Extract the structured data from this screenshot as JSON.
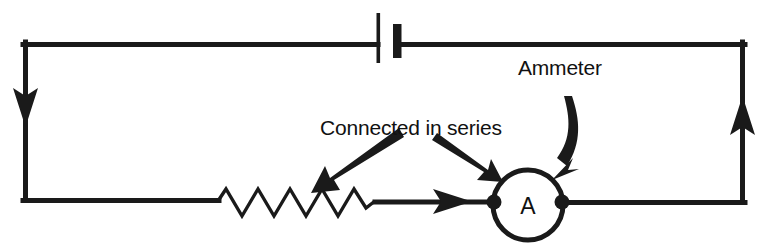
{
  "diagram": {
    "background_color": "#ffffff",
    "ink_color": "#1a1a1a",
    "annotations": {
      "ammeter_label": "Ammeter",
      "series_label": "Connected in series"
    },
    "components": {
      "ammeter": {
        "symbol_letter": "A",
        "name": "ammeter-symbol"
      },
      "battery": {
        "name": "battery-symbol",
        "positive_plate": "long-thin-plate",
        "negative_plate": "short-thick-plate"
      },
      "resistor": {
        "name": "resistor-symbol",
        "peaks": 5
      }
    },
    "current_arrows": [
      {
        "name": "current-arrow-left",
        "direction": "down"
      },
      {
        "name": "current-arrow-bottom",
        "direction": "right"
      },
      {
        "name": "current-arrow-right",
        "direction": "up"
      }
    ],
    "pointers": [
      {
        "name": "pointer-to-resistor",
        "target": "resistor",
        "style": "straight-tapered"
      },
      {
        "name": "pointer-to-ammeter",
        "target": "ammeter",
        "style": "straight-tapered"
      },
      {
        "name": "pointer-ammeter-curved",
        "target": "ammeter",
        "style": "curved-tapered"
      }
    ]
  }
}
